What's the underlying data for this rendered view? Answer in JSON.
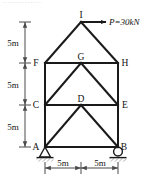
{
  "figure": {
    "type": "structural-truss-diagram",
    "partial_header_text": "··············",
    "stroke_color": "#1a1a1a",
    "dimension_color": "#4a4a4a",
    "text_color": "#111111",
    "background_color": "#ffffff"
  },
  "load": {
    "label": "P=30kN",
    "symbol": "P",
    "value": "30",
    "unit": "kN",
    "direction": "right",
    "applied_at": "I"
  },
  "nodes": [
    {
      "id": "A",
      "label": "A",
      "x": 45,
      "y": 147,
      "label_dx": -9,
      "label_dy": 0
    },
    {
      "id": "B",
      "label": "B",
      "x": 118,
      "y": 147,
      "label_dx": 5,
      "label_dy": 0
    },
    {
      "id": "C",
      "label": "C",
      "x": 45,
      "y": 105,
      "label_dx": -9,
      "label_dy": 0
    },
    {
      "id": "D",
      "label": "D",
      "x": 81,
      "y": 105,
      "label_dx": 0,
      "label_dy": -4
    },
    {
      "id": "E",
      "label": "E",
      "x": 118,
      "y": 105,
      "label_dx": 5,
      "label_dy": 0
    },
    {
      "id": "F",
      "label": "F",
      "x": 45,
      "y": 63,
      "label_dx": -9,
      "label_dy": 0
    },
    {
      "id": "G",
      "label": "G",
      "x": 81,
      "y": 63,
      "label_dx": 0,
      "label_dy": -4
    },
    {
      "id": "H",
      "label": "H",
      "x": 118,
      "y": 63,
      "label_dx": 5,
      "label_dy": 0
    },
    {
      "id": "I",
      "label": "I",
      "x": 81,
      "y": 22,
      "label_dx": 0,
      "label_dy": -4
    }
  ],
  "members": [
    {
      "from": "A",
      "to": "B",
      "kind": "chord"
    },
    {
      "from": "A",
      "to": "C",
      "kind": "column"
    },
    {
      "from": "B",
      "to": "E",
      "kind": "column"
    },
    {
      "from": "C",
      "to": "E",
      "kind": "chord"
    },
    {
      "from": "C",
      "to": "F",
      "kind": "column"
    },
    {
      "from": "E",
      "to": "H",
      "kind": "column"
    },
    {
      "from": "F",
      "to": "H",
      "kind": "chord"
    },
    {
      "from": "A",
      "to": "D",
      "kind": "diagonal"
    },
    {
      "from": "D",
      "to": "B",
      "kind": "diagonal"
    },
    {
      "from": "C",
      "to": "G",
      "kind": "diagonal"
    },
    {
      "from": "G",
      "to": "E",
      "kind": "diagonal"
    },
    {
      "from": "F",
      "to": "I",
      "kind": "rafter"
    },
    {
      "from": "I",
      "to": "H",
      "kind": "rafter"
    }
  ],
  "supports": [
    {
      "at": "A",
      "type": "pin",
      "name": "pin-support"
    },
    {
      "at": "B",
      "type": "roller",
      "name": "roller-support"
    }
  ],
  "dimensions": {
    "vertical": [
      {
        "label": "5m",
        "from": "I-level",
        "to": "F",
        "y_top": 22,
        "y_bottom": 63
      },
      {
        "label": "5m",
        "from": "F",
        "to": "C",
        "y_top": 63,
        "y_bottom": 105
      },
      {
        "label": "5m",
        "from": "C",
        "to": "A",
        "y_top": 105,
        "y_bottom": 147
      }
    ],
    "horizontal": [
      {
        "label": "5m",
        "from": "A",
        "to": "mid",
        "x_left": 45,
        "x_right": 81
      },
      {
        "label": "5m",
        "from": "mid",
        "to": "B",
        "x_left": 81,
        "x_right": 118
      }
    ],
    "vertical_axis_x": 25,
    "horizontal_axis_y": 168
  }
}
